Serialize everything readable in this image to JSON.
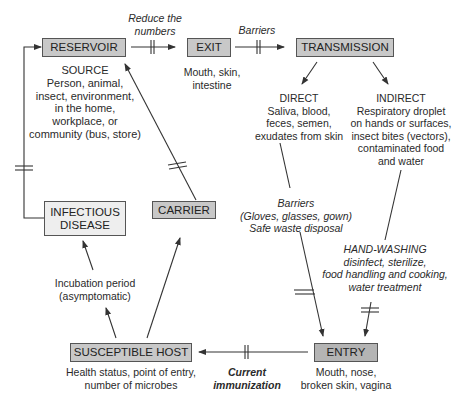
{
  "nodes": {
    "reservoir": "RESERVOIR",
    "exit": "EXIT",
    "transmission": "TRANSMISSION",
    "infectious_disease": [
      "INFECTIOUS",
      "DISEASE"
    ],
    "carrier": "CARRIER",
    "susceptible_host": "SUSCEPTIBLE HOST",
    "entry": "ENTRY"
  },
  "descriptions": {
    "source": [
      "SOURCE",
      "Person, animal,",
      "insect, environment,",
      "in the home,",
      "workplace, or",
      "community (bus, store)"
    ],
    "exit": [
      "Mouth, skin,",
      "intestine"
    ],
    "direct": [
      "DIRECT",
      "Saliva, blood,",
      "feces, semen,",
      "exudates from skin"
    ],
    "indirect": [
      "INDIRECT",
      "Respiratory droplet",
      "on hands or surfaces,",
      "insect bites (vectors),",
      "contaminated food",
      "and water"
    ],
    "incubation": [
      "Incubation period",
      "(asymptomatic)"
    ],
    "host": [
      "Health status, point of entry,",
      "number of microbes"
    ],
    "entry": [
      "Mouth, nose,",
      "broken skin, vagina"
    ]
  },
  "interventions": {
    "reduce_numbers": [
      "Reduce the",
      "numbers"
    ],
    "barriers_top": "Barriers",
    "barriers_direct": [
      "Barriers",
      "(Gloves, glasses, gown)",
      "Safe waste disposal"
    ],
    "hand_washing": [
      "HAND-WASHING",
      "disinfect, sterilize,",
      "food handling and cooking,",
      "water treatment"
    ],
    "immunization": [
      "Current",
      "immunization"
    ]
  },
  "colors": {
    "box_gray": "#c8c8c8",
    "box_light": "#eeeeee",
    "box_dark": "#b4b4b4",
    "line": "#333333"
  }
}
